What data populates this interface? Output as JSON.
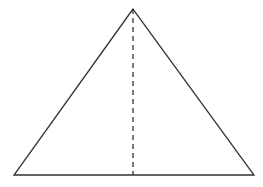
{
  "diagram": {
    "type": "isosceles-triangle-with-altitude",
    "canvas": {
      "width": 263,
      "height": 187,
      "background": "#ffffff"
    },
    "stroke_color": "#333333",
    "vertices": {
      "apex": [
        133,
        9
      ],
      "base_left": [
        14,
        175
      ],
      "base_right": [
        254,
        175
      ]
    },
    "altitude": {
      "from": [
        133,
        9
      ],
      "to": [
        133,
        175
      ],
      "style": "dashed"
    },
    "labels": []
  }
}
